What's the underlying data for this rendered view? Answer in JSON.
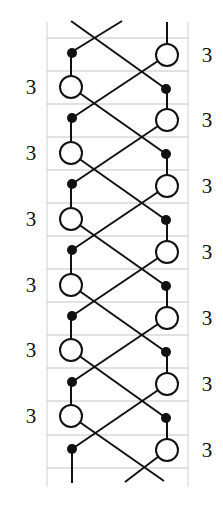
{
  "diagram": {
    "type": "lattice braid / chain diagram",
    "colors": {
      "stroke": "#111111",
      "grid": "#c4c4c4",
      "background": "#ffffff"
    },
    "grid": {
      "left": 47,
      "right": 188,
      "top": 22,
      "bottom": 487,
      "rows_y": [
        38,
        71,
        104,
        137,
        170,
        203,
        236,
        269,
        302,
        335,
        368,
        401,
        435,
        468
      ]
    },
    "left_labels": [
      {
        "text": "3",
        "y": 87
      },
      {
        "text": "3",
        "y": 153
      },
      {
        "text": "3",
        "y": 219
      },
      {
        "text": "3",
        "y": 285
      },
      {
        "text": "3",
        "y": 350
      },
      {
        "text": "3",
        "y": 416
      }
    ],
    "right_labels": [
      {
        "text": "3",
        "y": 55
      },
      {
        "text": "3",
        "y": 120
      },
      {
        "text": "3",
        "y": 186
      },
      {
        "text": "3",
        "y": 252
      },
      {
        "text": "3",
        "y": 318
      },
      {
        "text": "3",
        "y": 384
      },
      {
        "text": "3",
        "y": 450
      }
    ],
    "left_open_nodes": [
      87,
      153,
      219,
      285,
      350,
      416
    ],
    "left_filled_nodes": [
      53,
      118,
      184,
      250,
      316,
      382,
      449
    ],
    "right_open_nodes": [
      55,
      120,
      186,
      252,
      318,
      384,
      450
    ],
    "right_filled_nodes": [
      89,
      154,
      220,
      286,
      352,
      418
    ],
    "node_x": {
      "left": 71,
      "right": 167
    },
    "open_radius": 11,
    "filled_radius": 5
  }
}
